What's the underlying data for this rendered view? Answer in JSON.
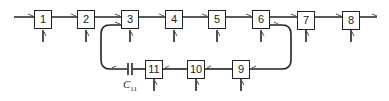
{
  "diagram": {
    "type": "block-chain-with-feedback-loop",
    "stroke_color": "#222222",
    "background": "#ffffff",
    "top_row": [
      {
        "id": "1",
        "label": "1"
      },
      {
        "id": "2",
        "label": "2"
      },
      {
        "id": "3",
        "label": "3"
      },
      {
        "id": "4",
        "label": "4"
      },
      {
        "id": "5",
        "label": "5"
      },
      {
        "id": "6",
        "label": "6"
      },
      {
        "id": "7",
        "label": "7"
      },
      {
        "id": "8",
        "label": "8"
      }
    ],
    "bottom_row": [
      {
        "id": "9",
        "label": "9"
      },
      {
        "id": "10",
        "label": "10"
      },
      {
        "id": "11",
        "label": "11"
      }
    ],
    "capacitor": {
      "label": "C",
      "subscript": "11"
    },
    "edges": [
      "in->1",
      "1->2",
      "2->3",
      "3->4",
      "4->5",
      "5->6",
      "6->7",
      "7->8",
      "8->out",
      "6->9",
      "9->10",
      "10->11",
      "11->C11",
      "C11->3"
    ]
  }
}
